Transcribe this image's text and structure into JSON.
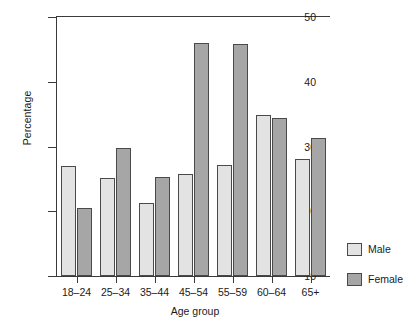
{
  "chart_data": {
    "type": "bar",
    "title": "",
    "xlabel": "Age group",
    "ylabel": "Percentage",
    "categories": [
      "18–24",
      "25–34",
      "35–44",
      "45–54",
      "55–59",
      "60–64",
      "65+"
    ],
    "series": [
      {
        "name": "Male",
        "color": "#e3e3e3",
        "values": [
          27.0,
          25.2,
          21.3,
          25.8,
          27.1,
          34.9,
          28.1
        ]
      },
      {
        "name": "Female",
        "color": "#a6a6a6",
        "values": [
          20.5,
          29.8,
          25.3,
          46.0,
          45.8,
          34.4,
          31.3
        ]
      }
    ],
    "ylim": [
      10,
      50
    ],
    "yticks": [
      10,
      20,
      30,
      40,
      50
    ],
    "ytick_labels": [
      "10",
      "20",
      "30",
      "40",
      "50"
    ],
    "grid": false,
    "legend_position": "right"
  },
  "legend": {
    "entries": [
      {
        "label": "Male"
      },
      {
        "label": "Female"
      }
    ]
  }
}
